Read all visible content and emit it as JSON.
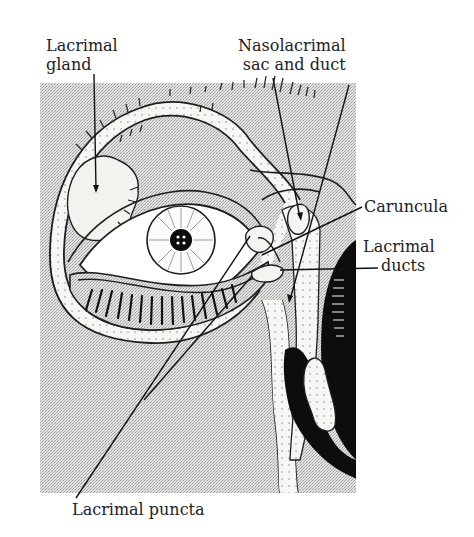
{
  "diagram": {
    "labels": {
      "lacrimal_gland": {
        "line1": "Lacrimal",
        "line2": "gland"
      },
      "nasolacrimal": {
        "line1": "Nasolacrimal",
        "line2": "sac and duct"
      },
      "caruncula": "Caruncula",
      "lacrimal_ducts": {
        "line1": "Lacrimal",
        "line2": "ducts"
      },
      "lacrimal_puncta": "Lacrimal puncta"
    },
    "colors": {
      "background": "#ffffff",
      "stipple": "#d6d6d6",
      "ink": "#1e1e1e",
      "tissue": "#f4f4f2",
      "cavity": "#0d0d0d"
    }
  }
}
